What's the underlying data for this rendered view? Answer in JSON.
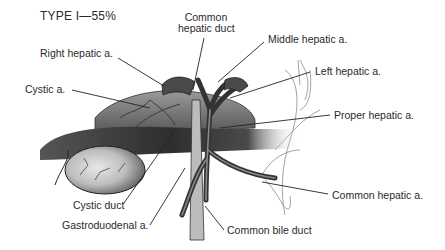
{
  "figure": {
    "title": "TYPE I—55%"
  },
  "labels": {
    "common_hepatic_duct_line1": "Common",
    "common_hepatic_duct_line2": "hepatic duct",
    "middle_hepatic_a": "Middle hepatic a.",
    "right_hepatic_a": "Right hepatic a.",
    "left_hepatic_a": "Left hepatic a.",
    "cystic_a": "Cystic a.",
    "proper_hepatic_a": "Proper hepatic a.",
    "cystic_duct": "Cystic duct",
    "common_hepatic_a": "Common hepatic a.",
    "gastroduodenal_a": "Gastroduodenal a.",
    "common_bile_duct": "Common bile duct"
  },
  "colors": {
    "background": "#ffffff",
    "text": "#2a2a2a",
    "leader_line": "#222222",
    "vessel_dark": "#3a3a3a",
    "vessel_mid": "#6e6e6e",
    "gallbladder_light": "#cfcfcf",
    "outline_light": "#9a9a9a"
  }
}
